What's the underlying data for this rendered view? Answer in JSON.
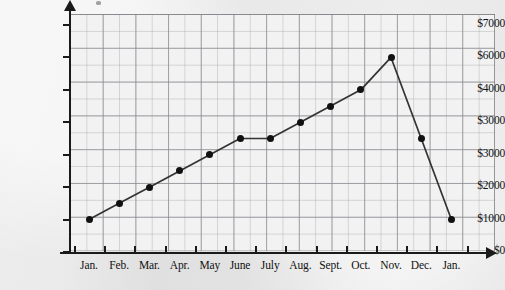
{
  "chart_data": {
    "type": "line",
    "title": "",
    "xlabel": "",
    "ylabel": "Bank balance",
    "categories": [
      "Jan.",
      "Feb.",
      "Mar.",
      "Apr.",
      "May",
      "June",
      "July",
      "Aug.",
      "Sept.",
      "Oct.",
      "Nov.",
      "Dec.",
      "Jan."
    ],
    "values": [
      1000,
      1500,
      2000,
      2500,
      3000,
      3500,
      3500,
      4000,
      4500,
      5000,
      6000,
      3500,
      1000
    ],
    "y_tick_labels": [
      "$0",
      "$1000",
      "$2000",
      "$3000",
      "$3000",
      "$4000",
      "$6000",
      "$7000"
    ],
    "y_tick_values": [
      0,
      1000,
      2000,
      3000,
      4000,
      5000,
      6000,
      7000
    ],
    "ylim": [
      0,
      7000
    ],
    "grid": true,
    "legend": "none",
    "marker": "filled-circle",
    "line_color": "#333333",
    "marker_color": "#111111"
  },
  "axes": {
    "y_title": "Bank balance"
  }
}
